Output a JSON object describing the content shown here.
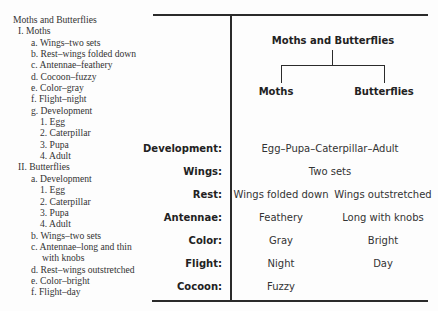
{
  "outline": {
    "title": "Moths and Butterflies",
    "items": [
      {
        "level": "lv1",
        "text": "I. Moths"
      },
      {
        "level": "lv2",
        "text": "a. Wings–two sets"
      },
      {
        "level": "lv2",
        "text": "b. Rest–wings folded down"
      },
      {
        "level": "lv2",
        "text": "c. Antennae–feathery"
      },
      {
        "level": "lv2",
        "text": "d. Cocoon–fuzzy"
      },
      {
        "level": "lv2",
        "text": "e. Color–gray"
      },
      {
        "level": "lv2",
        "text": "f. Flight–night"
      },
      {
        "level": "lv2",
        "text": "g. Development"
      },
      {
        "level": "lv3",
        "text": "1. Egg"
      },
      {
        "level": "lv3",
        "text": "2. Caterpillar"
      },
      {
        "level": "lv3",
        "text": "3. Pupa"
      },
      {
        "level": "lv3",
        "text": "4. Adult"
      },
      {
        "level": "lv1",
        "text": "II. Butterflies"
      },
      {
        "level": "lv2",
        "text": "a. Development"
      },
      {
        "level": "lv3",
        "text": "1. Egg"
      },
      {
        "level": "lv3",
        "text": "2. Caterpillar"
      },
      {
        "level": "lv3",
        "text": "3. Pupa"
      },
      {
        "level": "lv3",
        "text": "4. Adult"
      },
      {
        "level": "lv2",
        "text": "b. Wings–two sets"
      },
      {
        "level": "lv2",
        "text": "c. Antennae–long and thin"
      },
      {
        "level": "lv2c",
        "text": "with knobs"
      },
      {
        "level": "lv2",
        "text": "d. Rest–wings outstretched"
      },
      {
        "level": "lv2",
        "text": "e. Color–bright"
      },
      {
        "level": "lv2",
        "text": "f. Flight–day"
      }
    ]
  },
  "tree": {
    "root": "Moths and Butterflies",
    "left": "Moths",
    "right": "Butterflies"
  },
  "table": {
    "rows": [
      {
        "label": "Development:",
        "shared": "Egg–Pupa–Caterpillar–Adult"
      },
      {
        "label": "Wings:",
        "shared": "Two sets"
      },
      {
        "label": "Rest:",
        "moths": "Wings folded down",
        "butterflies": "Wings outstretched"
      },
      {
        "label": "Antennae:",
        "moths": "Feathery",
        "butterflies": "Long with knobs"
      },
      {
        "label": "Color:",
        "moths": "Gray",
        "butterflies": "Bright"
      },
      {
        "label": "Flight:",
        "moths": "Night",
        "butterflies": "Day"
      },
      {
        "label": "Cocoon:",
        "moths": "Fuzzy"
      }
    ]
  }
}
